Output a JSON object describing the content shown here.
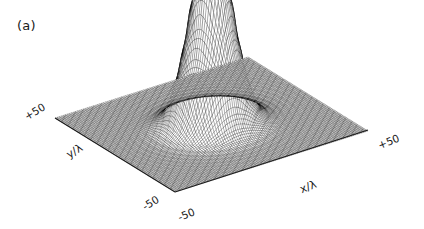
{
  "figure": {
    "panel_label": "(a)",
    "background_color": "#ffffff",
    "mesh_color": "#000000",
    "axis_line_color": "#1a1a1a"
  },
  "axes": {
    "x": {
      "label": "x/λ",
      "tick_min": "-50",
      "tick_max": "+50"
    },
    "y": {
      "label": "y/λ",
      "tick_min": "-50",
      "tick_max": "+50"
    }
  },
  "chart_data": {
    "type": "surface",
    "title": "(a)",
    "xlabel": "x/λ",
    "ylabel": "y/λ",
    "zlabel": "",
    "xlim": [
      -50,
      50
    ],
    "ylim": [
      -50,
      50
    ],
    "zlim": [
      0,
      1
    ],
    "xticklabels": [
      "-50",
      "+50"
    ],
    "yticklabels": [
      "-50",
      "+50"
    ],
    "grid": false,
    "legend": null,
    "projection": {
      "style": "parallel-oblique",
      "base_vertices_px": {
        "left": [
          55,
          118
        ],
        "bottom": [
          175,
          192
        ],
        "right": [
          368,
          130
        ],
        "top": [
          248,
          57
        ]
      },
      "z_height_px": 188
    },
    "surface_function": {
      "form": "radial_bessel_like",
      "expression": "z = (2*J1(k*r)/(k*r))^2 style airy envelope with ring maxima",
      "k": 0.2827,
      "grid_n": 96,
      "radial_decay": 1.5
    },
    "peaks": [
      {
        "name": "central main lobe",
        "r": 0,
        "relative_height": 1.0
      },
      {
        "name": "ring 1",
        "r": 11.0,
        "relative_height": 0.4
      },
      {
        "name": "ring 2",
        "r": 22.0,
        "relative_height": 0.2
      },
      {
        "name": "ring 3",
        "r": 33.0,
        "relative_height": 0.115
      },
      {
        "name": "ring 4",
        "r": 44.0,
        "relative_height": 0.072
      }
    ]
  }
}
